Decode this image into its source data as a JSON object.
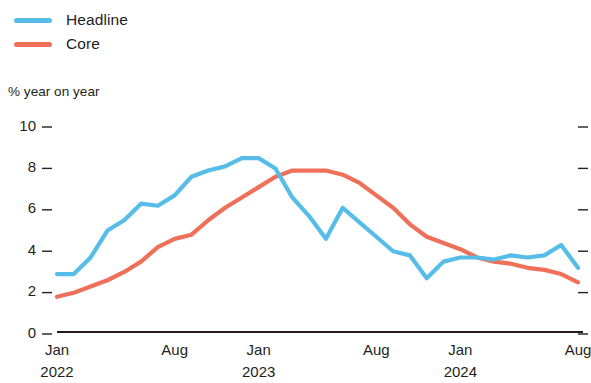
{
  "legend": {
    "position": "top-left",
    "items": [
      {
        "label": "Headline",
        "color": "#56bde8",
        "key": "headline"
      },
      {
        "label": "Core",
        "color": "#ef7058",
        "key": "core"
      }
    ]
  },
  "axis_title": "% year on year",
  "chart_data": {
    "type": "line",
    "title": "",
    "subtitle": "",
    "xlabel": "",
    "ylabel": "% year on year",
    "ylim": [
      0,
      10
    ],
    "yticks": [
      0,
      2,
      4,
      6,
      8,
      10
    ],
    "ytick_labels": [
      "0",
      "2",
      "4",
      "6",
      "8",
      "10"
    ],
    "grid": false,
    "legend_position": "top-left",
    "x_axis_ticks": [
      {
        "label": "Jan",
        "sublabel": "2022",
        "index": 0
      },
      {
        "label": "Aug",
        "sublabel": "",
        "index": 7
      },
      {
        "label": "Jan",
        "sublabel": "2023",
        "index": 12
      },
      {
        "label": "Aug",
        "sublabel": "",
        "index": 19
      },
      {
        "label": "Jan",
        "sublabel": "2024",
        "index": 24
      },
      {
        "label": "Aug",
        "sublabel": "",
        "index": 31
      }
    ],
    "x": [
      "Jan 2022",
      "Feb 2022",
      "Mar 2022",
      "Apr 2022",
      "May 2022",
      "Jun 2022",
      "Jul 2022",
      "Aug 2022",
      "Sep 2022",
      "Oct 2022",
      "Nov 2022",
      "Dec 2022",
      "Jan 2023",
      "Feb 2023",
      "Mar 2023",
      "Apr 2023",
      "May 2023",
      "Jun 2023",
      "Jul 2023",
      "Aug 2023",
      "Sep 2023",
      "Oct 2023",
      "Nov 2023",
      "Dec 2023",
      "Jan 2024",
      "Feb 2024",
      "Mar 2024",
      "Apr 2024",
      "May 2024",
      "Jun 2024",
      "Jul 2024",
      "Aug 2024"
    ],
    "series": [
      {
        "name": "Headline",
        "color": "#56bde8",
        "values": [
          2.8,
          2.8,
          3.6,
          4.9,
          5.4,
          6.2,
          6.1,
          6.6,
          7.5,
          7.8,
          8.0,
          8.4,
          8.4,
          7.9,
          6.5,
          5.6,
          4.5,
          6.0,
          5.3,
          4.6,
          3.9,
          3.7,
          2.6,
          3.4,
          3.6,
          3.6,
          3.5,
          3.7,
          3.6,
          3.7,
          4.2,
          3.1
        ]
      },
      {
        "name": "Core",
        "color": "#ef7058",
        "values": [
          1.7,
          1.9,
          2.2,
          2.5,
          2.9,
          3.4,
          4.1,
          4.5,
          4.7,
          5.4,
          6.0,
          6.5,
          7.0,
          7.5,
          7.8,
          7.8,
          7.8,
          7.6,
          7.2,
          6.6,
          6.0,
          5.2,
          4.6,
          4.3,
          4.0,
          3.6,
          3.4,
          3.3,
          3.1,
          3.0,
          2.8,
          2.4
        ]
      }
    ]
  }
}
